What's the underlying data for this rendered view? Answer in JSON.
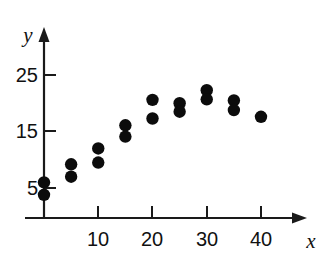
{
  "chart_data": {
    "type": "scatter",
    "title": "",
    "xlabel": "x",
    "ylabel": "y",
    "xlim": [
      0,
      43
    ],
    "ylim": [
      0,
      28
    ],
    "grid": false,
    "legend": null,
    "xticks": [
      10,
      20,
      30,
      40
    ],
    "xtick_labels": [
      "10",
      "20",
      "30",
      "40"
    ],
    "yticks": [
      5,
      15,
      25
    ],
    "ytick_labels": [
      "5",
      "15",
      "25"
    ],
    "axis_arrows": true,
    "point_color": "#0c0c0c",
    "axis_color": "#1a1a1a",
    "background": "#ffffff",
    "x": [
      0,
      0,
      5,
      5,
      10,
      10,
      15,
      15,
      20,
      20,
      25,
      25,
      30,
      30,
      35,
      35,
      40
    ],
    "y": [
      6.0,
      3.8,
      9.2,
      7.0,
      12.0,
      9.5,
      16.1,
      14.1,
      20.6,
      17.3,
      20.0,
      18.5,
      22.3,
      20.7,
      20.5,
      18.8,
      17.6
    ],
    "points": [
      {
        "x": 0,
        "y": 6.0
      },
      {
        "x": 0,
        "y": 3.8
      },
      {
        "x": 5,
        "y": 9.2
      },
      {
        "x": 5,
        "y": 7.0
      },
      {
        "x": 10,
        "y": 12.0
      },
      {
        "x": 10,
        "y": 9.5
      },
      {
        "x": 15,
        "y": 16.1
      },
      {
        "x": 15,
        "y": 14.1
      },
      {
        "x": 20,
        "y": 20.6
      },
      {
        "x": 20,
        "y": 17.3
      },
      {
        "x": 25,
        "y": 20.0
      },
      {
        "x": 25,
        "y": 18.5
      },
      {
        "x": 30,
        "y": 22.3
      },
      {
        "x": 30,
        "y": 20.7
      },
      {
        "x": 35,
        "y": 20.5
      },
      {
        "x": 35,
        "y": 18.8
      },
      {
        "x": 40,
        "y": 17.6
      }
    ]
  },
  "axis_labels": {
    "x": "x",
    "y": "y"
  }
}
